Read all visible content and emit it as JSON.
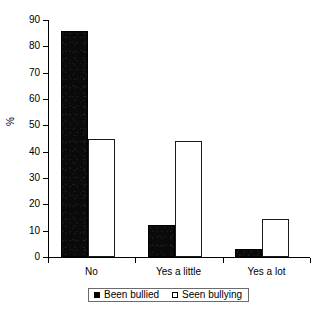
{
  "chart_data": {
    "type": "bar",
    "title": "",
    "subtitle": "",
    "xlabel": "",
    "ylabel": "%",
    "categories": [
      "No",
      "Yes a little",
      "Yes a lot"
    ],
    "series": [
      {
        "name": "Been bullied",
        "values": [
          86,
          12,
          3
        ],
        "color": "#000000",
        "style": "filled"
      },
      {
        "name": "Seen bullying",
        "values": [
          45,
          44,
          14.5
        ],
        "color": "#ffffff",
        "style": "hollow"
      }
    ],
    "ylim": [
      0,
      90
    ],
    "ytick_labels": [
      "0",
      "10",
      "20",
      "30",
      "40",
      "50",
      "60",
      "70",
      "80",
      "90"
    ],
    "ytick_values": [
      0,
      10,
      20,
      30,
      40,
      50,
      60,
      70,
      80,
      90
    ],
    "grid": false,
    "legend_position": "bottom",
    "legend_entries": [
      "Been bullied",
      "Seen bullying"
    ]
  },
  "axes": {
    "y_axis_label": "%",
    "y_title": "%"
  },
  "legend": {
    "items": [
      {
        "label": "Been bullied",
        "marker": "filled-square-icon"
      },
      {
        "label": "Seen bullying",
        "marker": "hollow-square-icon"
      }
    ]
  }
}
